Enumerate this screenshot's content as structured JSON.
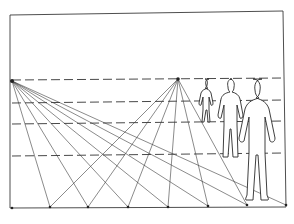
{
  "diagram": {
    "title": "",
    "kind": "perspective-drawing",
    "stroke_color": "#333333",
    "background_color": "#ffffff",
    "vanishing_points": [
      {
        "id": "vp-left",
        "label": ""
      },
      {
        "id": "vp-center",
        "label": ""
      }
    ],
    "ground_points_count": 8,
    "horizon_lines_count": 4,
    "figures": [
      {
        "id": "figure-far",
        "label": ""
      },
      {
        "id": "figure-middle",
        "label": ""
      },
      {
        "id": "figure-near",
        "label": ""
      }
    ]
  }
}
